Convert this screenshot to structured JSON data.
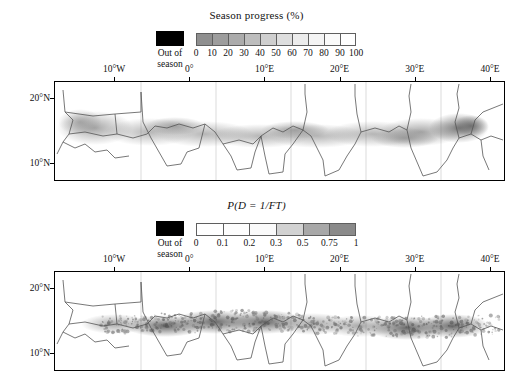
{
  "chart_data": {
    "type": "heatmap",
    "figure_title": "",
    "panels": [
      {
        "id": "season-progress",
        "colorbar": {
          "title": "Season progress (%)",
          "title_is_math": false,
          "tick_labels": [
            "0",
            "10",
            "20",
            "30",
            "40",
            "50",
            "60",
            "70",
            "80",
            "90",
            "100"
          ],
          "values": [
            0,
            10,
            20,
            30,
            40,
            50,
            60,
            70,
            80,
            90,
            100
          ],
          "n_cells": 10,
          "cell_colors": [
            "#8f8f8f",
            "#9d9d9d",
            "#ababab",
            "#bdbdbd",
            "#cfcfcf",
            "#dedede",
            "#ececec",
            "#f4f4f4",
            "#fafafa",
            "#ffffff"
          ],
          "orientation": "horizontal",
          "order": "dark-to-light"
        },
        "out_of_season": {
          "label": "Out of\nseason",
          "color": "#000000"
        },
        "xlabel": "",
        "ylabel": "",
        "xticks": [
          "10°W",
          "0°",
          "10°E",
          "20°E",
          "30°E",
          "40°E"
        ],
        "xtick_values": [
          -10,
          0,
          10,
          20,
          30,
          40
        ],
        "yticks": [
          "20°N",
          "10°N"
        ],
        "ytick_values": [
          20,
          10
        ],
        "xlim": [
          -18,
          42
        ],
        "ylim": [
          4,
          23
        ],
        "grid": false,
        "description": "Sahel band of gradual gray shading strongest between 10°N and 17°N, densest near 30°E–35°E"
      },
      {
        "id": "probability",
        "colorbar": {
          "title": "P(D = 1/FT)",
          "title_is_math": true,
          "tick_labels": [
            "0",
            "0.1",
            "0.2",
            "0.3",
            "0.5",
            "0.75",
            "1"
          ],
          "values": [
            0,
            0.1,
            0.2,
            0.3,
            0.5,
            0.75,
            1
          ],
          "n_cells": 6,
          "cell_colors": [
            "#ffffff",
            "#fdfdfd",
            "#fafafa",
            "#d2d2d2",
            "#a8a8a8",
            "#8a8a8a"
          ],
          "orientation": "horizontal",
          "order": "light-to-dark"
        },
        "out_of_season": {
          "label": "Out of\nseason",
          "color": "#000000"
        },
        "xlabel": "",
        "ylabel": "",
        "xticks": [
          "10°W",
          "0°",
          "10°E",
          "20°E",
          "30°E",
          "40°E"
        ],
        "xtick_values": [
          -10,
          0,
          10,
          20,
          30,
          40
        ],
        "yticks": [
          "20°N",
          "10°N"
        ],
        "ytick_values": [
          20,
          10
        ],
        "xlim": [
          -18,
          42
        ],
        "ylim": [
          4,
          23
        ],
        "grid": false,
        "description": "Speckled high-contrast Sahel band between 9°N and 16°N with strongest clusters near 5°E–15°E and 28°E–36°E"
      }
    ]
  }
}
